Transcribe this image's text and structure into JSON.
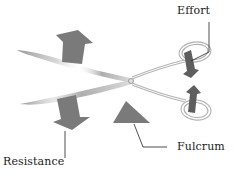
{
  "diagram": {
    "labels": {
      "effort": "Effort",
      "resistance": "Resistance",
      "fulcrum": "Fulcrum"
    },
    "icons": {
      "resistance_up_arrow": "arrow-up-icon",
      "resistance_down_arrow": "arrow-down-icon",
      "fulcrum_triangle": "triangle-icon",
      "effort_down_arrow": "arrow-down-icon",
      "effort_up_arrow": "arrow-up-icon"
    },
    "colors": {
      "arrow": "#7a7a7a",
      "effort_arrow": "#5e5e5e",
      "blade": "#8c8c8c",
      "handle_outline": "#b0b0b0",
      "leader_line": "#222222",
      "text": "#1a1a1a",
      "background": "#ffffff"
    }
  }
}
